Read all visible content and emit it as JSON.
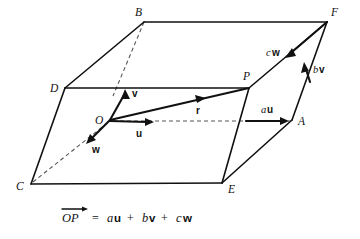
{
  "figure": {
    "background_color": "#ffffff",
    "ink_color": "#111111",
    "dash_color": "#555555"
  },
  "vertices": [
    {
      "id": "B",
      "label": "B",
      "x": 144,
      "y": 22,
      "label_x": 135,
      "label_y": 15
    },
    {
      "id": "F",
      "label": "F",
      "x": 327,
      "y": 22,
      "label_x": 331,
      "label_y": 14
    },
    {
      "id": "D",
      "label": "D",
      "x": 65,
      "y": 88,
      "label_x": 52,
      "label_y": 91
    },
    {
      "id": "P",
      "label": "P",
      "x": 249,
      "y": 88,
      "label_x": 243,
      "label_y": 79
    },
    {
      "id": "O",
      "label": "O",
      "x": 110,
      "y": 120,
      "label_x": 97,
      "label_y": 122
    },
    {
      "id": "A",
      "label": "A",
      "x": 292,
      "y": 120,
      "label_x": 298,
      "label_y": 124
    },
    {
      "id": "C",
      "label": "C",
      "x": 31,
      "y": 184,
      "label_x": 18,
      "label_y": 189
    },
    {
      "id": "E",
      "label": "E",
      "x": 222,
      "y": 183,
      "label_x": 228,
      "label_y": 192
    }
  ],
  "edges": [
    {
      "name": "edge-B-F",
      "from": "B",
      "to": "F",
      "style": "solid"
    },
    {
      "name": "edge-D-B",
      "from": "D",
      "to": "B",
      "style": "solid"
    },
    {
      "name": "edge-D-P",
      "from": "D",
      "to": "P",
      "style": "solid"
    },
    {
      "name": "edge-P-F",
      "from": "P",
      "to": "F",
      "style": "solid"
    },
    {
      "name": "edge-D-C",
      "from": "D",
      "to": "C",
      "style": "solid"
    },
    {
      "name": "edge-C-E",
      "from": "C",
      "to": "E",
      "style": "solid"
    },
    {
      "name": "edge-E-A",
      "from": "E",
      "to": "A",
      "style": "solid"
    },
    {
      "name": "edge-A-F",
      "from": "A",
      "to": "F",
      "style": "solid"
    },
    {
      "name": "edge-P-E",
      "from": "P",
      "to": "E",
      "style": "solid"
    },
    {
      "name": "edge-B-O",
      "from": "B",
      "to": "O",
      "style": "dashed"
    },
    {
      "name": "edge-C-O",
      "from": "C",
      "to": "O",
      "style": "dashed"
    },
    {
      "name": "edge-O-A",
      "from": "O",
      "to": "A",
      "style": "dashed"
    }
  ],
  "vectors": [
    {
      "name": "vector-v",
      "label": "v",
      "bold": true,
      "from_x": 110,
      "from_y": 120,
      "to_x": 125,
      "to_y": 92,
      "label_x": 130,
      "label_y": 95
    },
    {
      "name": "vector-u",
      "label": "u",
      "bold": true,
      "from_x": 110,
      "from_y": 120,
      "to_x": 152,
      "to_y": 122,
      "label_x": 140,
      "label_y": 135
    },
    {
      "name": "vector-w",
      "label": "w",
      "bold": true,
      "from_x": 110,
      "from_y": 120,
      "to_x": 89,
      "to_y": 141,
      "label_x": 96,
      "label_y": 150
    },
    {
      "name": "vector-r",
      "label": "r",
      "bold": true,
      "from_x": 110,
      "from_y": 120,
      "to_x": 249,
      "to_y": 88,
      "label_x": 197,
      "label_y": 113
    },
    {
      "name": "vector-au",
      "label": "au",
      "scalar": "a",
      "unit": "u",
      "from_x": 247,
      "from_y": 121,
      "to_x": 289,
      "to_y": 121,
      "label_x": 265,
      "label_y": 112
    },
    {
      "name": "vector-bv",
      "label": "bv",
      "scalar": "b",
      "unit": "v",
      "from_x": 309,
      "from_y": 82,
      "to_x": 305,
      "to_y": 63,
      "label_x": 313,
      "label_y": 72
    },
    {
      "name": "vector-cw",
      "label": "cw",
      "scalar": "c",
      "unit": "w",
      "from_x": 327,
      "from_y": 22,
      "to_x": 287,
      "to_y": 57,
      "label_x": 269,
      "label_y": 55
    }
  ],
  "caption": {
    "name": "caption-equation",
    "full_text": "OP = au + bv + cw",
    "parts": {
      "op": "OP",
      "equals": "=",
      "term_a_scalar": "a",
      "term_a_unit": "u",
      "plus_1": "+",
      "term_b_scalar": "b",
      "term_b_unit": "v",
      "plus_2": "+",
      "term_c_scalar": "c",
      "term_c_unit": "w"
    },
    "overbar_arrow": true,
    "x": 62,
    "y": 220
  }
}
